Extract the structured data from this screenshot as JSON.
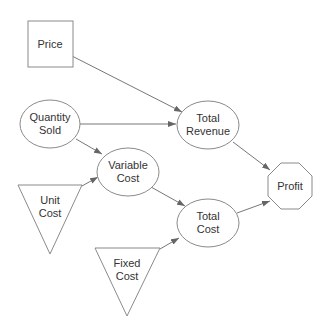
{
  "diagram": {
    "type": "influence-diagram",
    "nodes": [
      {
        "id": "price",
        "label": "Price",
        "shape": "rectangle",
        "kind": "decision"
      },
      {
        "id": "quantity_sold",
        "label_line1": "Quantity",
        "label_line2": "Sold",
        "shape": "ellipse",
        "kind": "chance"
      },
      {
        "id": "total_revenue",
        "label_line1": "Total",
        "label_line2": "Revenue",
        "shape": "ellipse",
        "kind": "chance"
      },
      {
        "id": "variable_cost",
        "label_line1": "Variable",
        "label_line2": "Cost",
        "shape": "ellipse",
        "kind": "chance"
      },
      {
        "id": "unit_cost",
        "label_line1": "Unit",
        "label_line2": "Cost",
        "shape": "triangle",
        "kind": "constant"
      },
      {
        "id": "total_cost",
        "label_line1": "Total",
        "label_line2": "Cost",
        "shape": "ellipse",
        "kind": "chance"
      },
      {
        "id": "fixed_cost",
        "label_line1": "Fixed",
        "label_line2": "Cost",
        "shape": "triangle",
        "kind": "constant"
      },
      {
        "id": "profit",
        "label": "Profit",
        "shape": "octagon",
        "kind": "value"
      }
    ],
    "edges": [
      {
        "from": "price",
        "to": "total_revenue"
      },
      {
        "from": "quantity_sold",
        "to": "total_revenue"
      },
      {
        "from": "quantity_sold",
        "to": "variable_cost"
      },
      {
        "from": "unit_cost",
        "to": "variable_cost"
      },
      {
        "from": "total_revenue",
        "to": "profit"
      },
      {
        "from": "variable_cost",
        "to": "total_cost"
      },
      {
        "from": "fixed_cost",
        "to": "total_cost"
      },
      {
        "from": "total_cost",
        "to": "profit"
      }
    ]
  },
  "colors": {
    "stroke": "#8a8a8a",
    "edge": "#777777",
    "text": "#333333",
    "background": "#ffffff"
  }
}
